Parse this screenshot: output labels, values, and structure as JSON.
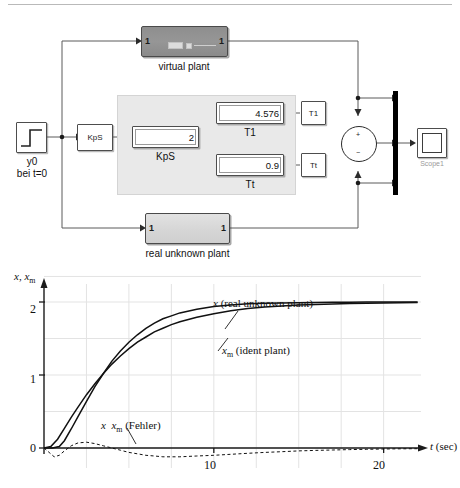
{
  "diagram": {
    "blocks": {
      "virtual_plant": {
        "label": "virtual plant",
        "in_port": "1",
        "out_port": "1"
      },
      "real_plant": {
        "label": "real unknown plant",
        "in_port": "1",
        "out_port": "1"
      },
      "step_source": {
        "label_line1": "y0",
        "label_line2": "bei t=0"
      },
      "kps_const": {
        "label": "KpS"
      },
      "t1_const": {
        "label": "T1"
      },
      "tt_const": {
        "label": "Tt"
      },
      "kps_display": {
        "value": "2",
        "caption": "KpS"
      },
      "t1_display": {
        "value": "4.576",
        "caption": "T1"
      },
      "tt_display": {
        "value": "0.9",
        "caption": "Tt"
      },
      "sum_block": {
        "sign_top": "+",
        "sign_bottom": "−"
      },
      "scope": {
        "label": "Scope1"
      }
    }
  },
  "chart_data": {
    "type": "line",
    "title": "",
    "xlabel": "t (sec)",
    "ylabel": "x, xm",
    "xlim": [
      0,
      22.2
    ],
    "ylim": [
      -0.35,
      2.45
    ],
    "xticks": [
      10,
      20
    ],
    "yticks": [
      0,
      1,
      2
    ],
    "grid": true,
    "legend_position": "inline-annotation",
    "annotations": [
      {
        "text": "x (real unknown plant)",
        "series": "x"
      },
      {
        "text": "xm (ident plant)",
        "series": "xm"
      },
      {
        "text": "x  xm (Fehler)",
        "series": "error"
      }
    ],
    "series": [
      {
        "name": "x (real unknown plant)",
        "style": "solid",
        "x": [
          0,
          0.5,
          0.9,
          1.2,
          1.6,
          2,
          2.5,
          3,
          3.5,
          4,
          4.5,
          5,
          5.5,
          6,
          6.5,
          7,
          7.5,
          8,
          9,
          10,
          11,
          12,
          13,
          14,
          15,
          16,
          17,
          18,
          19,
          20,
          21,
          22
        ],
        "y": [
          0,
          0,
          0.02,
          0.1,
          0.26,
          0.43,
          0.64,
          0.84,
          1.02,
          1.19,
          1.33,
          1.45,
          1.55,
          1.64,
          1.71,
          1.77,
          1.81,
          1.85,
          1.9,
          1.94,
          1.96,
          1.975,
          1.983,
          1.988,
          1.991,
          1.994,
          1.996,
          1.997,
          1.998,
          1.999,
          1.999,
          2.0
        ]
      },
      {
        "name": "xm (ident plant)",
        "style": "solid",
        "x": [
          0,
          0.4,
          0.8,
          1.2,
          1.6,
          2,
          2.5,
          3,
          3.5,
          4,
          4.5,
          5,
          5.5,
          6,
          6.5,
          7,
          7.5,
          8,
          9,
          10,
          11,
          12,
          13,
          14,
          15,
          16,
          17,
          18,
          19,
          20,
          21,
          22
        ],
        "y": [
          0,
          0.02,
          0.12,
          0.27,
          0.42,
          0.56,
          0.73,
          0.88,
          1.02,
          1.15,
          1.26,
          1.36,
          1.45,
          1.52,
          1.59,
          1.64,
          1.69,
          1.73,
          1.79,
          1.84,
          1.88,
          1.91,
          1.93,
          1.945,
          1.957,
          1.966,
          1.973,
          1.979,
          1.983,
          1.987,
          1.99,
          1.992
        ]
      },
      {
        "name": "x  xm (Fehler)",
        "style": "dashed",
        "x": [
          0,
          0.3,
          0.6,
          0.9,
          1.2,
          1.6,
          2,
          2.5,
          3,
          3.5,
          4,
          4.5,
          5,
          5.5,
          6,
          6.5,
          7,
          8,
          9,
          10,
          11,
          12,
          13,
          14,
          15,
          16,
          17,
          18,
          19,
          20,
          21,
          22
        ],
        "y": [
          0,
          -0.06,
          -0.12,
          -0.1,
          -0.04,
          0.03,
          0.07,
          0.08,
          0.06,
          0.03,
          0.0,
          -0.03,
          -0.06,
          -0.08,
          -0.1,
          -0.11,
          -0.12,
          -0.12,
          -0.11,
          -0.1,
          -0.086,
          -0.072,
          -0.06,
          -0.05,
          -0.04,
          -0.033,
          -0.027,
          -0.022,
          -0.018,
          -0.014,
          -0.011,
          -0.009
        ]
      }
    ]
  }
}
